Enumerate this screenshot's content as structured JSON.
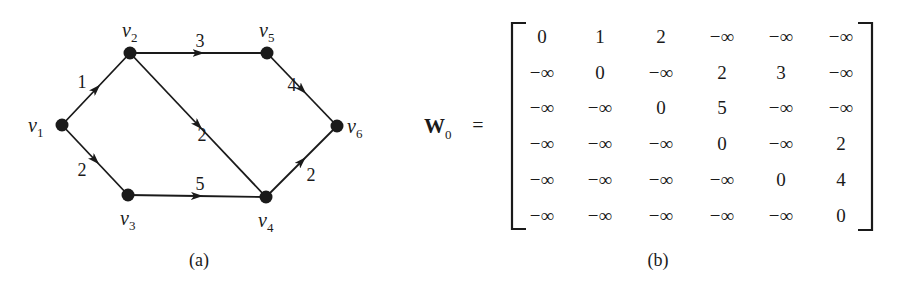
{
  "figure_a": {
    "caption": "(a)",
    "nodes": [
      {
        "id": "v1",
        "label": "v",
        "sub": "1",
        "x": 62,
        "y": 125
      },
      {
        "id": "v2",
        "label": "v",
        "sub": "2",
        "x": 130,
        "y": 53
      },
      {
        "id": "v3",
        "label": "v",
        "sub": "3",
        "x": 128,
        "y": 195
      },
      {
        "id": "v4",
        "label": "v",
        "sub": "4",
        "x": 266,
        "y": 197
      },
      {
        "id": "v5",
        "label": "v",
        "sub": "5",
        "x": 267,
        "y": 53
      },
      {
        "id": "v6",
        "label": "v",
        "sub": "6",
        "x": 337,
        "y": 126
      }
    ],
    "edges": [
      {
        "from": "v1",
        "to": "v2",
        "weight": "1"
      },
      {
        "from": "v1",
        "to": "v3",
        "weight": "2"
      },
      {
        "from": "v2",
        "to": "v5",
        "weight": "3"
      },
      {
        "from": "v2",
        "to": "v4",
        "weight": "2"
      },
      {
        "from": "v3",
        "to": "v4",
        "weight": "5"
      },
      {
        "from": "v5",
        "to": "v6",
        "weight": "4"
      },
      {
        "from": "v4",
        "to": "v6",
        "weight": "2"
      }
    ]
  },
  "figure_b": {
    "caption": "(b)",
    "matrix_name": "W",
    "matrix_sub": "0",
    "equals": "=",
    "rows": [
      [
        "0",
        "1",
        "2",
        "−∞",
        "−∞",
        "−∞"
      ],
      [
        "−∞",
        "0",
        "−∞",
        "2",
        "3",
        "−∞"
      ],
      [
        "−∞",
        "−∞",
        "0",
        "5",
        "−∞",
        "−∞"
      ],
      [
        "−∞",
        "−∞",
        "−∞",
        "0",
        "−∞",
        "2"
      ],
      [
        "−∞",
        "−∞",
        "−∞",
        "−∞",
        "0",
        "4"
      ],
      [
        "−∞",
        "−∞",
        "−∞",
        "−∞",
        "−∞",
        "0"
      ]
    ]
  }
}
